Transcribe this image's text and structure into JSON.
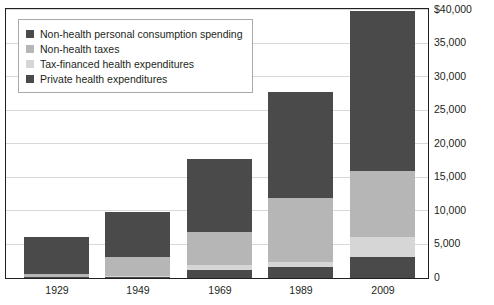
{
  "chart_data": {
    "type": "bar",
    "subtype": "stacked",
    "title": "",
    "xlabel": "",
    "ylabel": "",
    "categories": [
      "1929",
      "1949",
      "1969",
      "1989",
      "2009"
    ],
    "ylim": [
      0,
      40000
    ],
    "ytick_values": [
      0,
      5000,
      10000,
      15000,
      20000,
      25000,
      30000,
      35000,
      40000
    ],
    "ytick_labels": [
      "0",
      "5,000",
      "10,000",
      "15,000",
      "20,000",
      "25,000",
      "30,000",
      "35,000",
      "$40,000"
    ],
    "grid": true,
    "legend_position": "top-left",
    "stack_order_bottom_to_top": [
      "Private health expenditures",
      "Tax-financed health expenditures",
      "Non-health taxes",
      "Non-health personal consumption spending"
    ],
    "series": [
      {
        "name": "Private health expenditures",
        "color": "#4a4a4a",
        "values": [
          150,
          200,
          1200,
          1600,
          3100
        ]
      },
      {
        "name": "Tax-financed health expenditures",
        "color": "#d6d6d6",
        "values": [
          0,
          150,
          700,
          800,
          3000
        ]
      },
      {
        "name": "Non-health taxes",
        "color": "#b6b6b6",
        "values": [
          450,
          2800,
          5000,
          9600,
          9900
        ]
      },
      {
        "name": "Non-health personal consumption spending",
        "color": "#4a4a4a",
        "values": [
          5500,
          6650,
          10900,
          15700,
          23800
        ]
      }
    ],
    "totals": [
      6100,
      9800,
      17800,
      27700,
      39800
    ]
  },
  "legend": {
    "items": [
      {
        "label": "Non-health personal consumption spending",
        "color": "#4a4a4a"
      },
      {
        "label": "Non-health taxes",
        "color": "#b6b6b6"
      },
      {
        "label": "Tax-financed health expenditures",
        "color": "#d6d6d6"
      },
      {
        "label": "Private health expenditures",
        "color": "#4a4a4a"
      }
    ]
  },
  "axes": {
    "y_labels": [
      "$40,000",
      "35,000",
      "30,000",
      "25,000",
      "20,000",
      "15,000",
      "10,000",
      "5,000",
      "0"
    ],
    "x_labels": [
      "1929",
      "1949",
      "1969",
      "1989",
      "2009"
    ]
  },
  "colors": {
    "dark": "#4a4a4a",
    "medium": "#b6b6b6",
    "light": "#d6d6d6",
    "frame": "#231f20",
    "grid": "#d8d8d8",
    "background": "#ffffff"
  }
}
